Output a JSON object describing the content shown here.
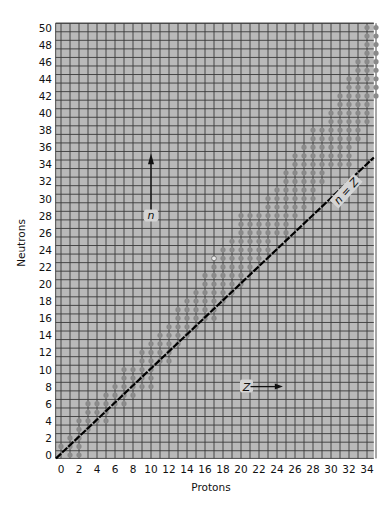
{
  "chart_data": {
    "type": "scatter",
    "title": "",
    "xlabel": "Protons",
    "ylabel": "Neutrons",
    "xlim": [
      0,
      35
    ],
    "ylim": [
      0,
      50
    ],
    "grid": true,
    "x_ticks": [
      0,
      2,
      4,
      6,
      8,
      10,
      12,
      14,
      16,
      18,
      20,
      22,
      24,
      26,
      28,
      30,
      32,
      34
    ],
    "y_ticks": [
      0,
      2,
      4,
      6,
      8,
      10,
      12,
      14,
      16,
      18,
      20,
      22,
      24,
      26,
      28,
      30,
      32,
      34,
      36,
      38,
      40,
      42,
      44,
      46,
      48,
      50
    ],
    "annotations": [
      {
        "text": "n",
        "type": "arrow-up",
        "position": {
          "Z": 10,
          "N": 34
        }
      },
      {
        "text": "Z",
        "type": "arrow-right",
        "position": {
          "Z": 20,
          "N": 8
        }
      },
      {
        "text": "n = Z",
        "type": "reference-line",
        "from": [
          0,
          0
        ],
        "to": [
          35,
          35
        ]
      }
    ],
    "series": [
      {
        "name": "Stable nuclides",
        "marker": "filled-circle",
        "band_by_neutron": [
          {
            "N": 0,
            "Z": [
              1,
              2
            ]
          },
          {
            "N": 1,
            "Z": [
              0,
              2
            ]
          },
          {
            "N": 2,
            "Z": [
              1,
              2
            ]
          },
          {
            "N": 3,
            "Z": [
              2,
              3
            ]
          },
          {
            "N": 4,
            "Z": [
              2,
              5
            ]
          },
          {
            "N": 5,
            "Z": [
              3,
              5
            ]
          },
          {
            "N": 6,
            "Z": [
              3,
              7
            ]
          },
          {
            "N": 7,
            "Z": [
              5,
              8
            ]
          },
          {
            "N": 8,
            "Z": [
              6,
              10
            ]
          },
          {
            "N": 9,
            "Z": [
              7,
              10
            ]
          },
          {
            "N": 10,
            "Z": [
              7,
              10
            ]
          },
          {
            "N": 11,
            "Z": [
              9,
              12
            ]
          },
          {
            "N": 12,
            "Z": [
              9,
              12
            ]
          },
          {
            "N": 13,
            "Z": [
              10,
              13
            ]
          },
          {
            "N": 14,
            "Z": [
              11,
              14
            ]
          },
          {
            "N": 15,
            "Z": [
              12,
              15
            ]
          },
          {
            "N": 16,
            "Z": [
              13,
              17
            ]
          },
          {
            "N": 17,
            "Z": [
              13,
              17
            ]
          },
          {
            "N": 18,
            "Z": [
              14,
              18
            ]
          },
          {
            "N": 19,
            "Z": [
              15,
              19
            ]
          },
          {
            "N": 20,
            "Z": [
              16,
              20
            ]
          },
          {
            "N": 21,
            "Z": [
              16,
              20
            ]
          },
          {
            "N": 22,
            "Z": [
              17,
              21
            ]
          },
          {
            "N": 23,
            "Z": [
              18,
              22
            ]
          },
          {
            "N": 24,
            "Z": [
              18,
              23
            ]
          },
          {
            "N": 25,
            "Z": [
              19,
              23
            ]
          },
          {
            "N": 26,
            "Z": [
              20,
              25
            ]
          },
          {
            "N": 27,
            "Z": [
              20,
              25
            ]
          },
          {
            "N": 28,
            "Z": [
              20,
              26
            ]
          },
          {
            "N": 29,
            "Z": [
              23,
              27
            ]
          },
          {
            "N": 30,
            "Z": [
              23,
              28
            ]
          },
          {
            "N": 31,
            "Z": [
              24,
              28
            ]
          },
          {
            "N": 32,
            "Z": [
              25,
              29
            ]
          },
          {
            "N": 33,
            "Z": [
              25,
              29
            ]
          },
          {
            "N": 34,
            "Z": [
              26,
              32
            ]
          },
          {
            "N": 35,
            "Z": [
              26,
              32
            ]
          },
          {
            "N": 36,
            "Z": [
              27,
              32
            ]
          },
          {
            "N": 37,
            "Z": [
              28,
              33
            ]
          },
          {
            "N": 38,
            "Z": [
              28,
              33
            ]
          },
          {
            "N": 39,
            "Z": [
              30,
              34
            ]
          },
          {
            "N": 40,
            "Z": [
              30,
              34
            ]
          },
          {
            "N": 41,
            "Z": [
              31,
              34
            ]
          },
          {
            "N": 42,
            "Z": [
              31,
              35
            ]
          },
          {
            "N": 43,
            "Z": [
              32,
              35
            ]
          },
          {
            "N": 44,
            "Z": [
              32,
              35
            ]
          },
          {
            "N": 45,
            "Z": [
              33,
              35
            ]
          },
          {
            "N": 46,
            "Z": [
              33,
              35
            ]
          },
          {
            "N": 47,
            "Z": [
              34,
              35
            ]
          },
          {
            "N": 48,
            "Z": [
              34,
              35
            ]
          },
          {
            "N": 49,
            "Z": [
              34,
              35
            ]
          },
          {
            "N": 50,
            "Z": [
              34,
              35
            ]
          }
        ]
      },
      {
        "name": "Long-lived radioactive nuclide",
        "marker": "open-circle",
        "points": [
          {
            "Z": 17,
            "N": 23
          }
        ]
      }
    ],
    "colors": {
      "background": "#ffffff",
      "grid_fill": "#b9b9b9",
      "grid_line": "#3a3a3a",
      "dot": "#8a8a8a",
      "line": "#000000"
    }
  }
}
